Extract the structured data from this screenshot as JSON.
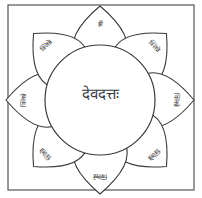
{
  "diagram": {
    "center_label": "देवदत्तः",
    "petal_reading_note": "Only the top petal (ह्रीं) was legible. The other seven are assumed from a common yantra pattern and are unverified.",
    "petals": [
      {
        "position": "top",
        "label": "ह्रीं",
        "reading": "legible"
      },
      {
        "position": "top-right",
        "label": "क्लिन्ने",
        "reading": "assumed"
      },
      {
        "position": "right",
        "label": "क्लिन्ने",
        "reading": "assumed"
      },
      {
        "position": "bottom-right",
        "label": "क्लिन्ने",
        "reading": "assumed"
      },
      {
        "position": "bottom",
        "label": "क्लिन्ने",
        "reading": "assumed"
      },
      {
        "position": "bottom-left",
        "label": "क्लिन्ने",
        "reading": "assumed"
      },
      {
        "position": "left",
        "label": "क्लिन्ने",
        "reading": "assumed"
      },
      {
        "position": "top-left",
        "label": "क्लिन्ने",
        "reading": "assumed"
      }
    ],
    "colors": {
      "ink": "#3a3a3a",
      "paper": "#ffffff",
      "frame": "#555555"
    }
  }
}
